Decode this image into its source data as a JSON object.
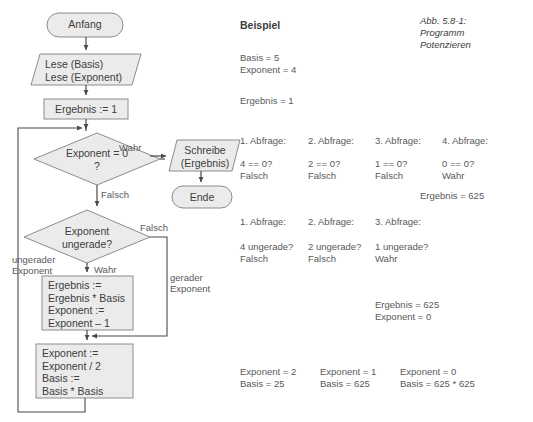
{
  "figure": {
    "caption": "Abb. 5.8-1:\nProgramm\nPotenzieren",
    "example_heading": "Beispiel"
  },
  "colors": {
    "shape_fill": "#ebebeb",
    "shape_stroke": "#8c8c8c",
    "line": "#6e6e6e",
    "text": "#3d3d3d",
    "muted_text": "#58595b",
    "background": "#ffffff"
  },
  "flowchart": {
    "nodes": [
      {
        "id": "start",
        "shape": "terminator",
        "label": "Anfang"
      },
      {
        "id": "read",
        "shape": "parallelogram",
        "label": "Lese (Basis)\nLese (Exponent)"
      },
      {
        "id": "init",
        "shape": "process",
        "label": "Ergebnis := 1"
      },
      {
        "id": "check-zero",
        "shape": "decision",
        "label": "Exponent = 0\n?"
      },
      {
        "id": "write",
        "shape": "parallelogram",
        "label": "Schreibe\n(Ergebnis)"
      },
      {
        "id": "end",
        "shape": "terminator",
        "label": "Ende"
      },
      {
        "id": "check-odd",
        "shape": "decision",
        "label": "Exponent\nungerade?"
      },
      {
        "id": "odd-body",
        "shape": "process",
        "label": "Ergebnis :=\nErgebnis * Basis\nExponent :=\nExponent – 1"
      },
      {
        "id": "halve",
        "shape": "process",
        "label": "Exponent :=\nExponent / 2\nBasis :=\nBasis * Basis"
      }
    ],
    "edge_labels": [
      {
        "id": "zero-true",
        "text": "Wahr"
      },
      {
        "id": "zero-false",
        "text": "Falsch"
      },
      {
        "id": "odd-false",
        "text": "Falsch"
      },
      {
        "id": "odd-true",
        "text": "Wahr"
      },
      {
        "id": "odd-branch",
        "text": "ungerader\nExponent"
      },
      {
        "id": "even-branch",
        "text": "gerader\nExponent"
      }
    ]
  },
  "example": {
    "initial": "Basis = 5\nExponent = 4",
    "initial_result": "Ergebnis = 1",
    "zero_queries": {
      "headers": [
        "1. Abfrage:",
        "2. Abfrage:",
        "3. Abfrage:",
        "4. Abfrage:"
      ],
      "tests": [
        "4 == 0?\nFalsch",
        "2 == 0?\nFalsch",
        "1 == 0?\nFalsch",
        "0 == 0?\nWahr"
      ],
      "result": "Ergebnis = 625"
    },
    "odd_queries": {
      "headers": [
        "1. Abfrage:",
        "2. Abfrage:",
        "3. Abfrage:"
      ],
      "tests": [
        "4 ungerade?\nFalsch",
        "2 ungerade?\nFalsch",
        "1 ungerade?\nWahr"
      ]
    },
    "mid_state": "Ergebnis = 625\nExponent = 0",
    "final_states": [
      "Exponent = 2\nBasis = 25",
      "Exponent = 1\nBasis = 625",
      "Exponent = 0\nBasis = 625 * 625"
    ]
  }
}
